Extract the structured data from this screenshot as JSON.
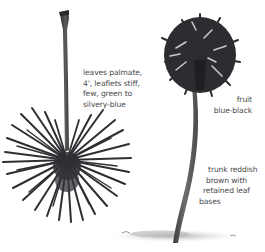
{
  "illustration": {
    "subject": "palm tree with detached palmate leaf",
    "colors": {
      "background": "#ffffff",
      "leaf": "#2f2f33",
      "trunk": "#5a5a5a",
      "shadow": "#bdbdbd",
      "text": "#4a4a4a"
    }
  },
  "annotations": {
    "leaf": {
      "lines": [
        "leaves palmate,",
        "4', leaflets stiff,",
        "few, green to",
        "silvery-blue"
      ]
    },
    "fruit": {
      "lines": [
        "fruit",
        "blue-black"
      ]
    },
    "trunk": {
      "lines": [
        "trunk reddish",
        "brown with",
        "retained leaf",
        "bases"
      ]
    }
  }
}
